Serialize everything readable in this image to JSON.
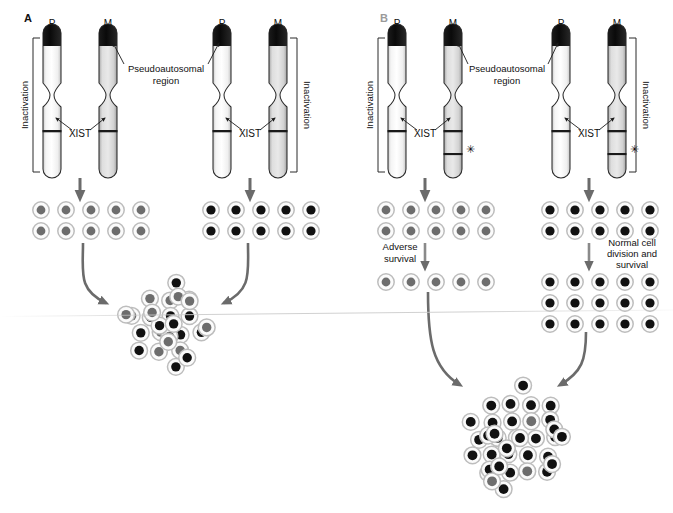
{
  "figure": {
    "panels": [
      {
        "id": "A",
        "label": "A",
        "x": 0,
        "width": 362,
        "pairs": [
          {
            "id": "a-left",
            "left_chrom_label": "P",
            "right_chrom_label": "M",
            "xist_label": "XIST",
            "bracket_label": "Inactivation",
            "bracket_side": "left",
            "bracket_target": "P",
            "has_asterisk": false,
            "asterisk": ""
          },
          {
            "id": "a-right",
            "left_chrom_label": "P",
            "right_chrom_label": "M",
            "xist_label": "XIST",
            "bracket_label": "Inactivation",
            "bracket_side": "right",
            "bracket_target": "M",
            "has_asterisk": false,
            "asterisk": ""
          }
        ],
        "pseudoautosomal_label_line1": "Pseudoautosomal",
        "pseudoautosomal_label_line2": "region",
        "clone_left": {
          "rows": 2,
          "cols": 5,
          "nucleus": "gray",
          "nucleus_color": "#6d6d6d"
        },
        "clone_right": {
          "rows": 2,
          "cols": 5,
          "nucleus": "black",
          "nucleus_color": "#111111"
        },
        "mosaic": {
          "total_cells": 26,
          "black_cells": 13,
          "gray_cells": 13,
          "description": "Random mosaic of cells with paternal or maternal X inactivated"
        },
        "step_labels": []
      },
      {
        "id": "B",
        "label": "B",
        "x": 362,
        "width": 311,
        "pairs": [
          {
            "id": "b-left",
            "left_chrom_label": "P",
            "right_chrom_label": "M",
            "xist_label": "XIST",
            "bracket_label": "Inactivation",
            "bracket_side": "left",
            "bracket_target": "P",
            "has_asterisk": true,
            "asterisk": "✳"
          },
          {
            "id": "b-right",
            "left_chrom_label": "P",
            "right_chrom_label": "M",
            "xist_label": "XIST",
            "bracket_label": "Inactivation",
            "bracket_side": "right",
            "bracket_target": "M",
            "has_asterisk": true,
            "asterisk": "✳"
          }
        ],
        "pseudoautosomal_label_line1": "Pseudoautosomal",
        "pseudoautosomal_label_line2": "region",
        "clone_left": {
          "rows": 2,
          "cols": 5,
          "nucleus": "gray",
          "nucleus_color": "#6d6d6d"
        },
        "clone_right": {
          "rows": 2,
          "cols": 5,
          "nucleus": "black",
          "nucleus_color": "#111111"
        },
        "clone_left_after": {
          "rows": 1,
          "cols": 5,
          "nucleus": "gray",
          "nucleus_color": "#6d6d6d"
        },
        "clone_right_after": {
          "rows": 3,
          "cols": 5,
          "nucleus": "black",
          "nucleus_color": "#111111"
        },
        "mosaic": {
          "total_cells": 35,
          "black_cells": 32,
          "gray_cells": 3,
          "description": "Skewed population dominated by cells with the mutant X inactivated"
        },
        "step_labels": [
          {
            "id": "adverse-survival",
            "lines": [
              "Adverse",
              "survival"
            ],
            "side": "left"
          },
          {
            "id": "normal-survival",
            "lines": [
              "Normal cell",
              "division and",
              "survival"
            ],
            "side": "right"
          }
        ]
      }
    ],
    "colors": {
      "paternal_fill": "#fdfdfd",
      "maternal_fill": "#d9d9d9",
      "cap_fill": "#121212",
      "outline": "#2b2b2b",
      "arrow": "#6b6b6b",
      "band": "#1a1a1a",
      "gray_nucleus": "#6d6d6d",
      "black_nucleus": "#111111",
      "cell_ring": "#bdbdbd"
    },
    "legend_notes": {
      "cap_meaning": "Pseudoautosomal region (black cap)",
      "band_meaning": "XIST locus (horizontal band)",
      "asterisk_meaning": "Mutation on maternal X"
    }
  }
}
